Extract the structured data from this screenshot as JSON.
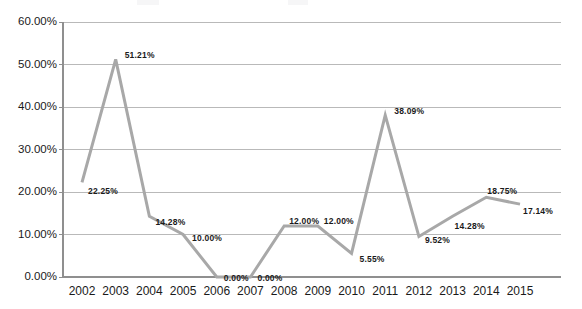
{
  "chart_data": {
    "type": "line",
    "title": "",
    "xlabel": "",
    "ylabel": "",
    "categories": [
      "2002",
      "2003",
      "2004",
      "2005",
      "2006",
      "2007",
      "2008",
      "2009",
      "2010",
      "2011",
      "2012",
      "2013",
      "2014",
      "2015"
    ],
    "values": [
      22.25,
      51.21,
      14.28,
      10.0,
      0.0,
      0.0,
      12.0,
      12.0,
      5.55,
      38.09,
      9.52,
      14.28,
      18.75,
      17.14
    ],
    "point_labels": [
      "22.25%",
      "51.21%",
      "14.28%",
      "10.00%",
      "0.00%",
      "0.00%",
      "12.00%",
      "12.00%",
      "5.55%",
      "38.09%",
      "9.52%",
      "14.28%",
      "18.75%",
      "17.14%"
    ],
    "ylim": [
      0,
      60
    ],
    "ytick_values": [
      0,
      10,
      20,
      30,
      40,
      50,
      60
    ],
    "ytick_labels": [
      "0.00%",
      "10.00%",
      "20.00%",
      "30.00%",
      "40.00%",
      "50.00%",
      "60.00%"
    ],
    "grid": true,
    "legend": "none",
    "series_color": "#a8a8a8",
    "gridline_color": "#b9b9b9",
    "axis_color": "#8f8f8f",
    "label_color": "#1a1a1a",
    "background_color": "#ffffff",
    "line_width": 3,
    "markers": false
  }
}
